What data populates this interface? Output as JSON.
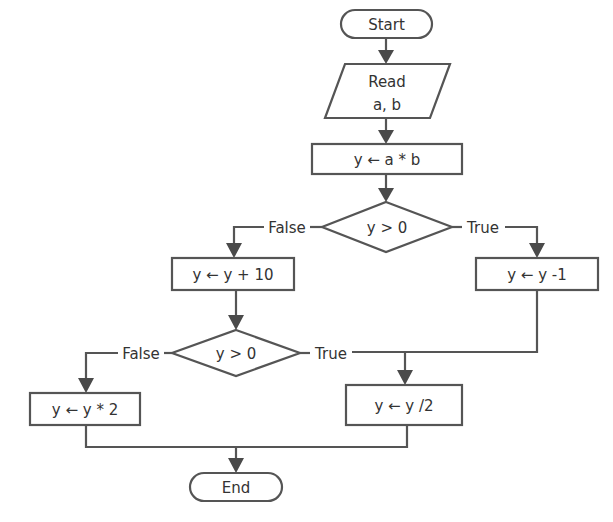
{
  "diagram": {
    "type": "flowchart",
    "nodes": {
      "start": {
        "shape": "terminator",
        "label": "Start"
      },
      "read": {
        "shape": "input-output",
        "line1": "Read",
        "line2": "a, b"
      },
      "assign_ab": {
        "shape": "process",
        "label": "y ← a * b"
      },
      "decision1": {
        "shape": "decision",
        "label": "y > 0"
      },
      "add10": {
        "shape": "process",
        "label": "y ← y + 10"
      },
      "minus1": {
        "shape": "process",
        "label": "y ← y -1"
      },
      "decision2": {
        "shape": "decision",
        "label": "y > 0"
      },
      "times2": {
        "shape": "process",
        "label": "y ← y * 2"
      },
      "half": {
        "shape": "process",
        "label": "y ← y /2"
      },
      "end": {
        "shape": "terminator",
        "label": "End"
      }
    },
    "edges": {
      "d1_false": "False",
      "d1_true": "True",
      "d2_false": "False",
      "d2_true": "True"
    },
    "colors": {
      "stroke": "#555555",
      "fill": "#ffffff",
      "text": "#333333"
    }
  }
}
